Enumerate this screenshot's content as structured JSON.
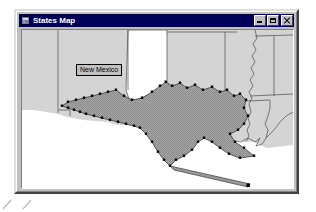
{
  "window": {
    "title": "States Map",
    "app_icon": "map-app-icon",
    "controls": [
      {
        "name": "minimize",
        "label": "_",
        "icon": "minimize-icon"
      },
      {
        "name": "maximize",
        "label": "□",
        "icon": "maximize-icon"
      },
      {
        "name": "close",
        "label": "×",
        "icon": "close-icon"
      }
    ]
  },
  "map": {
    "label_box": {
      "text": "New Mexico",
      "x": 54,
      "y": 34
    },
    "selected_state": "Texas",
    "colors": {
      "land_fill": "#d4d4d4",
      "selected_fill": "#a0a0a0",
      "border": "#4a4a4a",
      "water": "#ffffff",
      "handle": "#000000",
      "panhandle_fill": "#ffffff"
    },
    "background": "#ffffff",
    "selection_handles_visible": true
  },
  "desktop": {
    "tick_marks": [
      "tick-1",
      "tick-2"
    ]
  }
}
